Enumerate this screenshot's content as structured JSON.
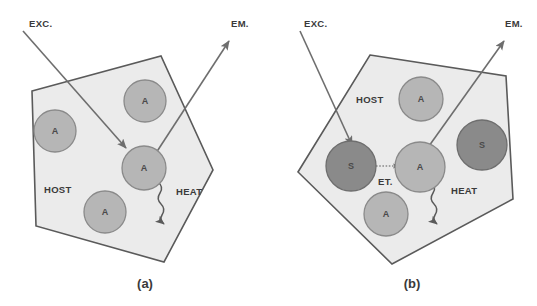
{
  "figure": {
    "background_color": "#ffffff",
    "width": 537,
    "height": 306
  },
  "colors": {
    "host_fill": "#ebebeb",
    "host_stroke": "#5a5a5a",
    "activator_fill": "#b6b6b6",
    "activator_stroke": "#8a8a8a",
    "sensitizer_fill": "#8a8a8a",
    "sensitizer_stroke": "#6e6e6e",
    "arrow_color": "#6e6e6e",
    "text_color": "#3a3a3a"
  },
  "panels": [
    {
      "id": "a",
      "caption": "(a)",
      "host_label": "HOST",
      "excitation_label": "EXC.",
      "emission_label": "EM.",
      "heat_label": "HEAT",
      "ions": [
        {
          "symbol": "A",
          "type": "activator",
          "position": "left"
        },
        {
          "symbol": "A",
          "type": "activator",
          "position": "top"
        },
        {
          "symbol": "A",
          "type": "activator",
          "position": "center"
        },
        {
          "symbol": "A",
          "type": "activator",
          "position": "bottom"
        }
      ]
    },
    {
      "id": "b",
      "caption": "(b)",
      "host_label": "HOST",
      "excitation_label": "EXC.",
      "emission_label": "EM.",
      "heat_label": "HEAT",
      "energy_transfer_label": "ET.",
      "ions": [
        {
          "symbol": "A",
          "type": "activator",
          "position": "top"
        },
        {
          "symbol": "S",
          "type": "sensitizer",
          "position": "left"
        },
        {
          "symbol": "A",
          "type": "activator",
          "position": "center"
        },
        {
          "symbol": "S",
          "type": "sensitizer",
          "position": "right"
        },
        {
          "symbol": "A",
          "type": "activator",
          "position": "bottom"
        }
      ]
    }
  ]
}
